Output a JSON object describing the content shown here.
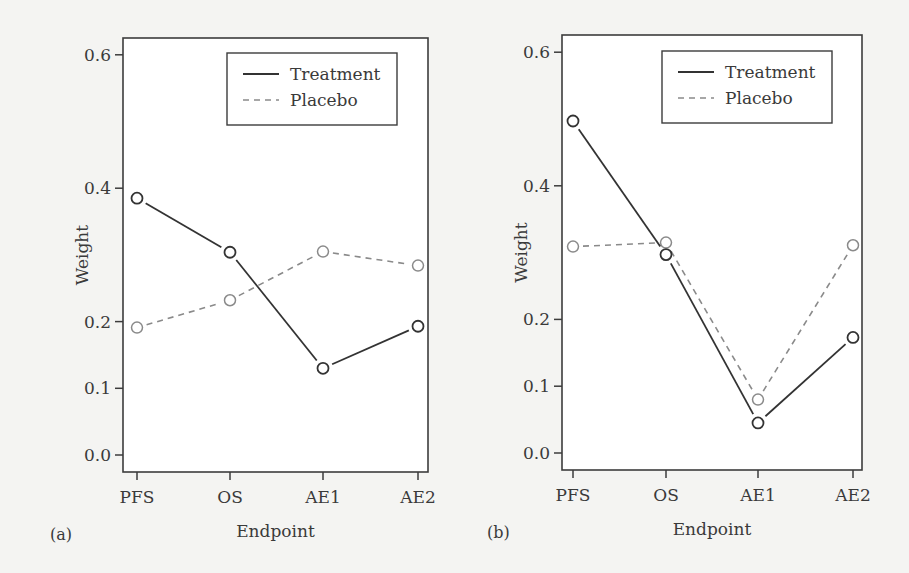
{
  "chart_data": [
    {
      "type": "line",
      "panel_label": "(a)",
      "title": "",
      "xlabel": "Endpoint",
      "ylabel": "Weight",
      "categories": [
        "PFS",
        "OS",
        "AE1",
        "AE2"
      ],
      "yticks": [
        "0.0",
        "0.1",
        "0.2",
        "0.4",
        "0.6"
      ],
      "ytick_values": [
        0.0,
        0.1,
        0.2,
        0.4,
        0.6
      ],
      "ylim": [
        -0.025,
        0.625
      ],
      "grid": false,
      "legend": {
        "placement": "top-right",
        "entries": [
          "Treatment",
          "Placebo"
        ]
      },
      "series": [
        {
          "name": "Treatment",
          "style": "solid",
          "values": [
            0.385,
            0.304,
            0.13,
            0.193
          ]
        },
        {
          "name": "Placebo",
          "style": "dashed",
          "values": [
            0.191,
            0.232,
            0.305,
            0.284
          ]
        }
      ]
    },
    {
      "type": "line",
      "panel_label": "(b)",
      "title": "",
      "xlabel": "Endpoint",
      "ylabel": "Weight",
      "categories": [
        "PFS",
        "OS",
        "AE1",
        "AE2"
      ],
      "yticks": [
        "0.0",
        "0.1",
        "0.2",
        "0.4",
        "0.6"
      ],
      "ytick_values": [
        0.0,
        0.1,
        0.2,
        0.4,
        0.6
      ],
      "ylim": [
        -0.025,
        0.625
      ],
      "grid": false,
      "legend": {
        "placement": "top-right",
        "entries": [
          "Treatment",
          "Placebo"
        ]
      },
      "series": [
        {
          "name": "Treatment",
          "style": "solid",
          "values": [
            0.497,
            0.297,
            0.045,
            0.173
          ]
        },
        {
          "name": "Placebo",
          "style": "dashed",
          "values": [
            0.309,
            0.315,
            0.08,
            0.311
          ]
        }
      ]
    }
  ]
}
